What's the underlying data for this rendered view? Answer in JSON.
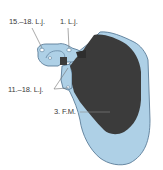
{
  "diagram": {
    "type": "anatomical-illustration",
    "colors": {
      "bone_fill": "#aed0e6",
      "bone_outline": "#5b7d99",
      "attachment_area": "#3b3b3b",
      "leader_line": "#707070",
      "label_text": "#3a3a3a",
      "background": "#ffffff"
    },
    "labels": [
      {
        "id": "15-18-lj",
        "text": "15.–18. L.j."
      },
      {
        "id": "1-lj",
        "text": "1. L.j."
      },
      {
        "id": "11-18-lj",
        "text": "11.–18. L.j."
      },
      {
        "id": "3-fm",
        "text": "3. F.M."
      }
    ]
  }
}
